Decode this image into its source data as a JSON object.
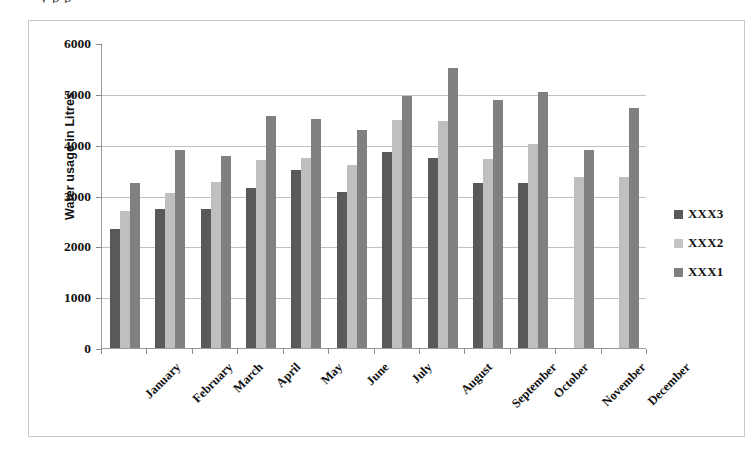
{
  "top_cutoff_text": "y                                                 p  p",
  "chart_data": {
    "type": "bar",
    "title": "",
    "xlabel": "",
    "ylabel": "Water usage in Litres",
    "ylim": [
      0,
      6000
    ],
    "ytick_values": [
      6000,
      5000,
      4000,
      3000,
      2000,
      1000,
      0
    ],
    "ytick_labels": [
      "6000",
      "5000",
      "4000",
      "3000",
      "2000",
      "1000",
      "0"
    ],
    "grid": true,
    "legend_position": "right",
    "categories": [
      "January",
      "February",
      "March",
      "April",
      "May",
      "June",
      "July",
      "August",
      "September",
      "October",
      "November",
      "December"
    ],
    "series": [
      {
        "name": "XXX3",
        "color": "#595959",
        "values": [
          2350,
          2730,
          2740,
          3150,
          3500,
          3060,
          3850,
          3730,
          3250,
          3250,
          null,
          null
        ]
      },
      {
        "name": "XXX2",
        "color": "#bfbfbf",
        "values": [
          2700,
          3040,
          3260,
          3700,
          3740,
          3600,
          4480,
          4470,
          3720,
          4010,
          3370,
          3370
        ]
      },
      {
        "name": "XXX1",
        "color": "#808080",
        "values": [
          3240,
          3900,
          3770,
          4560,
          4500,
          4280,
          4950,
          5500,
          4880,
          5040,
          3900,
          4720
        ]
      }
    ],
    "legend_order": [
      "XXX3",
      "XXX2",
      "XXX1"
    ]
  }
}
